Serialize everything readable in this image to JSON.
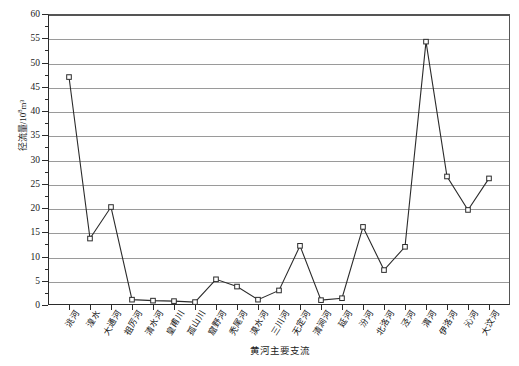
{
  "chart_data": {
    "type": "line",
    "title": "",
    "xlabel": "黄河主要支流",
    "ylabel": "径流量/10⁸m³",
    "ylabel_base": "径流量/10",
    "ylabel_exp": "8",
    "ylabel_unit": "m³",
    "ylim": [
      0,
      60
    ],
    "ytick_step": 5,
    "yticks": [
      "0",
      "5",
      "10",
      "15",
      "20",
      "25",
      "30",
      "35",
      "40",
      "45",
      "50",
      "55",
      "60"
    ],
    "grid": "horizontal",
    "legend": "none",
    "marker": "open-square",
    "line_color": "#2b2b2b",
    "grid_color": "#9a9a9a",
    "axis_color": "#2b2b2b",
    "categories": [
      "洮河",
      "湟水",
      "大通河",
      "祖厉河",
      "清水河",
      "皇甫川",
      "孤山川",
      "窟野河",
      "秃尾河",
      "漠水河",
      "三川河",
      "无定河",
      "清涧河",
      "延河",
      "汾河",
      "北洛河",
      "泾河",
      "渭河",
      "伊洛河",
      "沁河",
      "大汶河"
    ],
    "values": [
      47.0,
      13.7,
      20.2,
      1.1,
      0.9,
      0.8,
      0.6,
      5.3,
      3.8,
      1.1,
      3.0,
      12.2,
      1.0,
      1.4,
      16.1,
      7.2,
      12.0,
      54.3,
      26.5,
      19.6,
      26.1
    ]
  }
}
